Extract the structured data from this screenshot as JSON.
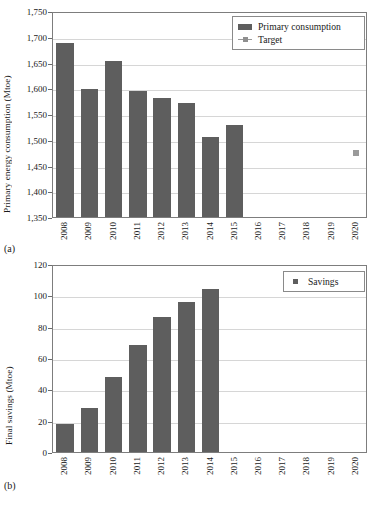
{
  "figure": {
    "panel_a_tag": "(a)",
    "panel_b_tag": "(b)"
  },
  "chart_data": [
    {
      "id": "primary-energy-consumption",
      "type": "bar",
      "title": "",
      "panel_label": "(a)",
      "xlabel": "",
      "ylabel": "Primary energy consumption (Mtoe)",
      "categories": [
        "2008",
        "2009",
        "2010",
        "2011",
        "2012",
        "2013",
        "2014",
        "2015",
        "2016",
        "2017",
        "2018",
        "2019",
        "2020"
      ],
      "ylim": [
        1350,
        1750
      ],
      "yticks": [
        "1,350",
        "1,400",
        "1,450",
        "1,500",
        "1,550",
        "1,600",
        "1,650",
        "1,700",
        "1,750"
      ],
      "ytick_values": [
        1350,
        1400,
        1450,
        1500,
        1550,
        1600,
        1650,
        1700,
        1750
      ],
      "grid": true,
      "legend_position": "top-right",
      "series": [
        {
          "name": "Primary consumption",
          "marker": "bar",
          "color": "#5e5e5e",
          "values": [
            1687,
            1599,
            1652,
            1595,
            1581,
            1571,
            1506,
            1529,
            null,
            null,
            null,
            null,
            null
          ]
        },
        {
          "name": "Target",
          "marker": "line-square",
          "color": "#9a9a9a",
          "values": [
            null,
            null,
            null,
            null,
            null,
            null,
            null,
            null,
            null,
            null,
            null,
            null,
            1478
          ]
        }
      ]
    },
    {
      "id": "final-savings",
      "type": "bar",
      "title": "",
      "panel_label": "(b)",
      "xlabel": "",
      "ylabel": "Final savings (Mtoe)",
      "categories": [
        "2008",
        "2009",
        "2010",
        "2011",
        "2012",
        "2013",
        "2014",
        "2015",
        "2016",
        "2017",
        "2018",
        "2019",
        "2020"
      ],
      "ylim": [
        0,
        120
      ],
      "yticks": [
        "0",
        "20",
        "40",
        "60",
        "80",
        "100",
        "120"
      ],
      "ytick_values": [
        0,
        20,
        40,
        60,
        80,
        100,
        120
      ],
      "grid": true,
      "legend_position": "top-right",
      "series": [
        {
          "name": "Savings",
          "marker": "bar",
          "color": "#5e5e5e",
          "values": [
            18,
            28,
            48,
            68,
            86,
            96,
            104,
            null,
            null,
            null,
            null,
            null,
            null
          ]
        }
      ]
    }
  ]
}
